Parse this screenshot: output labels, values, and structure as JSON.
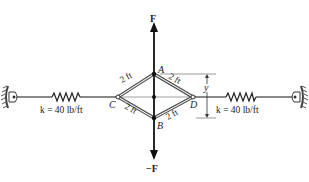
{
  "diagram": {
    "type": "mechanics-linkage-with-springs",
    "forces": {
      "top": "F",
      "bottom": "−F"
    },
    "points": {
      "A": "A",
      "B": "B",
      "C": "C",
      "D": "D"
    },
    "members": [
      {
        "from": "A",
        "to": "C",
        "length_label": "2 ft"
      },
      {
        "from": "A",
        "to": "D",
        "length_label": "2 ft"
      },
      {
        "from": "C",
        "to": "B",
        "length_label": "2 ft"
      },
      {
        "from": "B",
        "to": "D",
        "length_label": "2 ft"
      }
    ],
    "dimension": {
      "label": "y"
    },
    "springs": [
      {
        "side": "left",
        "label": "k = 40 lb/ft"
      },
      {
        "side": "right",
        "label": "k = 40 lb/ft"
      }
    ],
    "colors": {
      "line": "#222222",
      "member_fill": "#ffffff",
      "axis": "#999999"
    }
  }
}
